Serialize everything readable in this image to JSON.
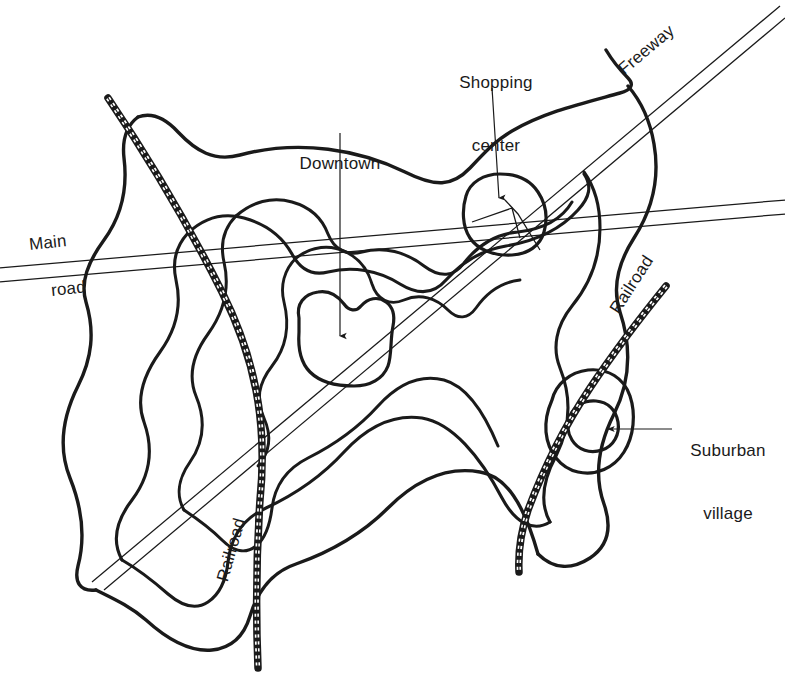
{
  "figure": {
    "background_color": "#ffffff",
    "ink_color": "#1a1a1a",
    "width": 785,
    "height": 700
  },
  "labels": {
    "shopping_center": {
      "line1": "Shopping",
      "line2": "center"
    },
    "downtown": {
      "line1": "Downtown"
    },
    "suburban_village": {
      "line1": "Suburban",
      "line2": "village"
    },
    "freeway": {
      "text": "Freeway"
    },
    "main_road_line1": {
      "text": "Main"
    },
    "main_road_line2": {
      "text": "road"
    },
    "railroad_nw": {
      "text": "Railroad"
    },
    "railroad_se": {
      "text": "Railroad"
    }
  },
  "peaks": [
    {
      "name": "Downtown",
      "x": 340,
      "y": 340,
      "rank": "primary",
      "contour_rings": 1
    },
    {
      "name": "Shopping center",
      "x": 500,
      "y": 210,
      "rank": "secondary",
      "contour_rings": 1
    },
    {
      "name": "Suburban village",
      "x": 590,
      "y": 430,
      "rank": "tertiary",
      "contour_rings": 2
    }
  ],
  "transport": [
    {
      "name": "Main road",
      "style": "double-line",
      "from": [
        0,
        262
      ],
      "to": [
        785,
        206
      ]
    },
    {
      "name": "Freeway",
      "style": "double-line",
      "from": [
        95,
        578
      ],
      "to": [
        782,
        10
      ]
    },
    {
      "name": "Railroad",
      "style": "hatched-track",
      "from": [
        108,
        98
      ],
      "to": [
        258,
        668
      ]
    },
    {
      "name": "Railroad",
      "style": "hatched-track",
      "from": [
        666,
        286
      ],
      "to": [
        520,
        572
      ]
    }
  ],
  "contours": {
    "count": 4,
    "description": "Nested closed isopleths of decreasing density outward"
  },
  "colors": {
    "ink": "#1a1a1a",
    "paper": "#ffffff"
  }
}
